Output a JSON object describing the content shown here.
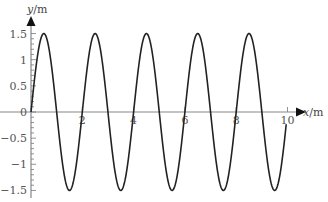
{
  "chart_data": {
    "type": "line",
    "title": "",
    "xlabel": "x/m",
    "ylabel": "y/m",
    "xlim": [
      0,
      10
    ],
    "ylim": [
      -1.5,
      1.5
    ],
    "grid": false,
    "legend": null,
    "x_ticks": [
      0,
      2,
      4,
      6,
      8,
      10
    ],
    "x_tick_labels": [
      "2",
      "4",
      "6",
      "8",
      "10"
    ],
    "y_ticks": [
      1.5,
      1,
      0.5,
      0,
      -0.5,
      -1,
      -1.5
    ],
    "y_tick_labels": [
      "1.5",
      "1",
      "0.5",
      "0",
      "−0.5",
      "−1",
      "−1.5"
    ],
    "series": [
      {
        "name": "y = 1.5 sin(πx)",
        "function": "1.5*sin(pi*x)",
        "amplitude": 1.5,
        "wavelength": 2,
        "x_range": [
          0,
          9.95
        ],
        "x": [
          0,
          0.5,
          1,
          1.5,
          2,
          2.5,
          3,
          3.5,
          4,
          4.5,
          5,
          5.5,
          6,
          6.5,
          7,
          7.5,
          8,
          8.5,
          9,
          9.5,
          9.95
        ],
        "y": [
          0,
          1.5,
          0,
          -1.5,
          0,
          1.5,
          0,
          -1.5,
          0,
          1.5,
          0,
          -1.5,
          0,
          1.5,
          0,
          -1.5,
          0,
          1.5,
          0,
          -1.5,
          -0.24
        ],
        "color": "#222222"
      }
    ]
  },
  "labels": {
    "x_axis": "x/m",
    "y_axis": "y/m",
    "origin": "0"
  }
}
